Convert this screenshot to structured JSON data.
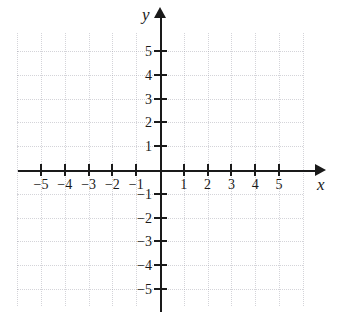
{
  "figure": {
    "kind": "cartesian-coordinate-plane",
    "title": "",
    "background_color": "#ffffff",
    "axis_color": "#1a1a1a",
    "grid_color": "#9a9aa6"
  },
  "axes": {
    "x": {
      "name": "x",
      "arrow": "right",
      "tick_labels": [
        "-5",
        "-4",
        "-3",
        "-2",
        "-1",
        "1",
        "2",
        "3",
        "4",
        "5"
      ],
      "tick_values": [
        -5,
        -4,
        -3,
        -2,
        -1,
        1,
        2,
        3,
        4,
        5
      ],
      "range": [
        -6,
        6.7
      ]
    },
    "y": {
      "name": "y",
      "arrow": "up",
      "tick_labels": [
        "5",
        "4",
        "3",
        "2",
        "1",
        "-1",
        "-2",
        "-3",
        "-4",
        "-5"
      ],
      "tick_values": [
        5,
        4,
        3,
        2,
        1,
        -1,
        -2,
        -3,
        -4,
        -5
      ],
      "range": [
        -5.9,
        6.4
      ]
    },
    "origin_label": ""
  },
  "chart_data": {
    "type": "scatter",
    "title": "",
    "xlabel": "x",
    "ylabel": "y",
    "x": [],
    "y": [],
    "series": [],
    "xticks": [
      -5,
      -4,
      -3,
      -2,
      -1,
      1,
      2,
      3,
      4,
      5
    ],
    "yticks": [
      -5,
      -4,
      -3,
      -2,
      -1,
      1,
      2,
      3,
      4,
      5
    ],
    "xticklabels": [
      "-5",
      "-4",
      "-3",
      "-2",
      "-1",
      "1",
      "2",
      "3",
      "4",
      "5"
    ],
    "yticklabels": [
      "-5",
      "-4",
      "-3",
      "-2",
      "-1",
      "1",
      "2",
      "3",
      "4",
      "5"
    ],
    "xlim": [
      -6,
      6.7
    ],
    "ylim": [
      -5.9,
      6.4
    ],
    "grid": true,
    "grid_style": "dotted",
    "legend": null,
    "annotations": [],
    "note": "Empty graph paper: blank Cartesian grid with labeled x and y axes, no plotted data."
  }
}
